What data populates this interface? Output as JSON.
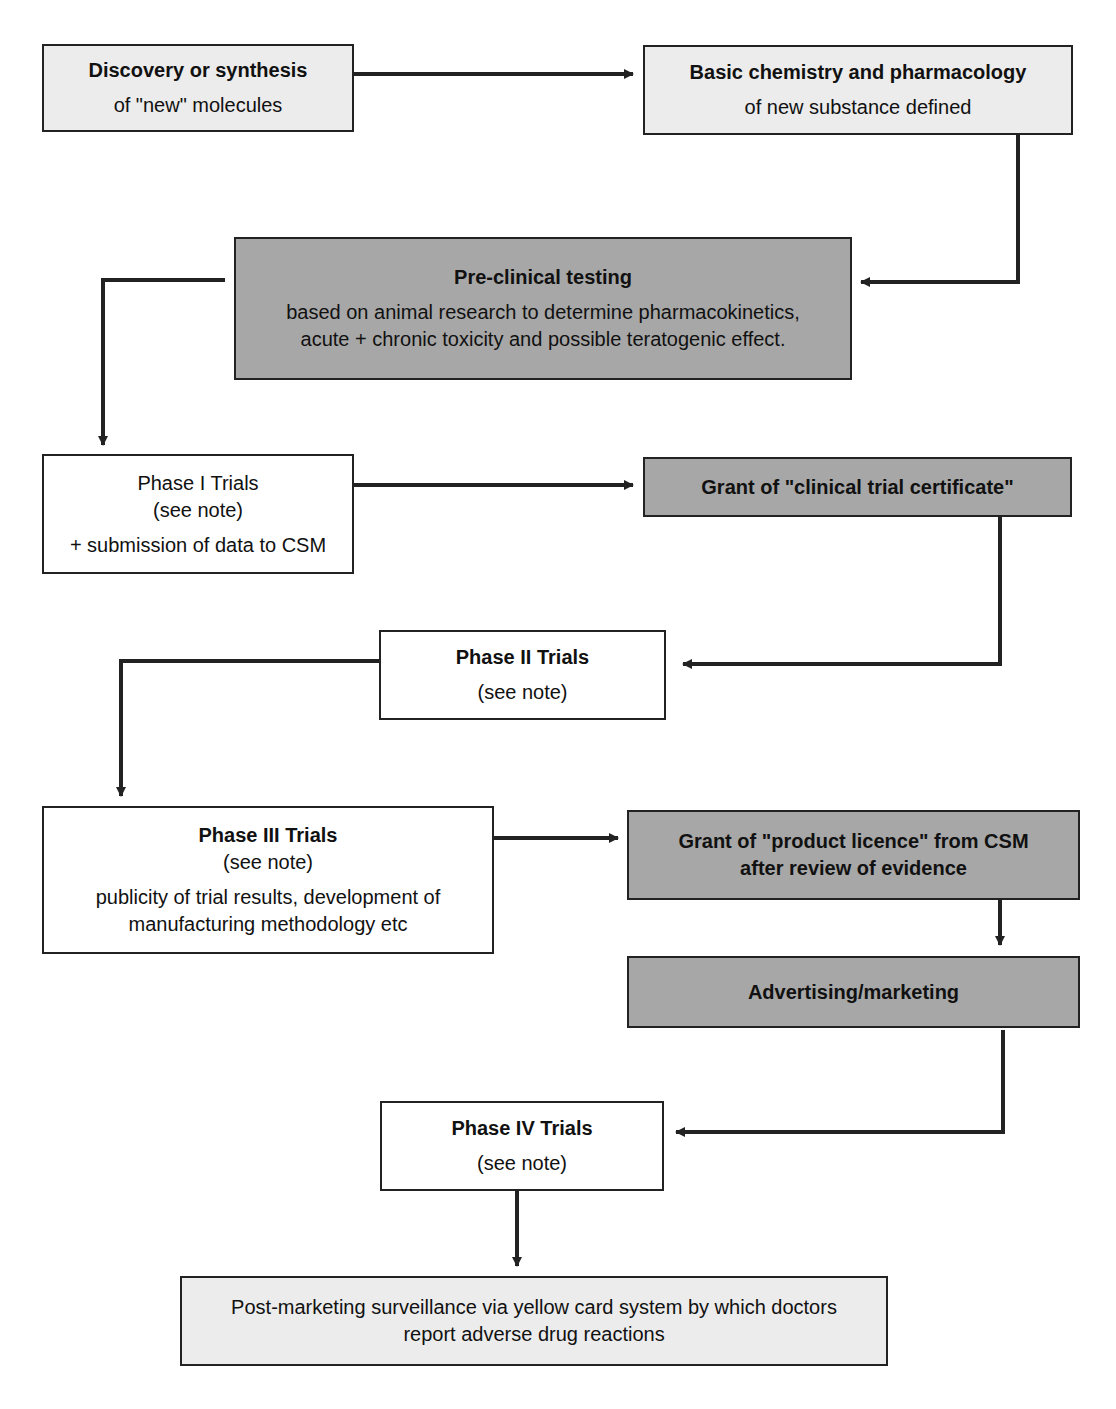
{
  "diagram": {
    "type": "flowchart",
    "colors": {
      "light_box": "#ececec",
      "dark_box": "#a7a7a7",
      "white_box": "#ffffff",
      "line": "#222222"
    },
    "nodes": {
      "discovery": {
        "title": "Discovery or synthesis",
        "sub": "of  \"new\" molecules"
      },
      "basic": {
        "title": "Basic chemistry and pharmacology",
        "sub": "of new substance defined"
      },
      "preclinical": {
        "title": "Pre-clinical testing",
        "line1": "based on animal research to determine pharmacokinetics,",
        "line2": "acute + chronic toxicity and possible teratogenic effect."
      },
      "phase1": {
        "title": "Phase I Trials",
        "note": "(see note)",
        "sub": "+ submission of data to CSM"
      },
      "ctc": {
        "title": "Grant of \"clinical trial certificate\""
      },
      "phase2": {
        "title": "Phase II Trials",
        "note": "(see note)"
      },
      "phase3": {
        "title": "Phase III Trials",
        "note": "(see note)",
        "line1": "publicity of trial results, development of",
        "line2": "manufacturing methodology etc"
      },
      "licence": {
        "line1": "Grant of \"product licence\" from CSM",
        "line2": "after review of evidence"
      },
      "advertising": {
        "title": "Advertising/marketing"
      },
      "phase4": {
        "title": "Phase IV Trials",
        "note": "(see note)"
      },
      "surveillance": {
        "line1": "Post-marketing surveillance via yellow card system by which doctors",
        "line2": "report adverse drug reactions"
      }
    },
    "edges": [
      [
        "discovery",
        "basic"
      ],
      [
        "basic",
        "preclinical"
      ],
      [
        "preclinical",
        "phase1"
      ],
      [
        "phase1",
        "ctc"
      ],
      [
        "ctc",
        "phase2"
      ],
      [
        "phase2",
        "phase3"
      ],
      [
        "phase3",
        "licence"
      ],
      [
        "licence",
        "advertising"
      ],
      [
        "advertising",
        "phase4"
      ],
      [
        "phase4",
        "surveillance"
      ]
    ]
  }
}
